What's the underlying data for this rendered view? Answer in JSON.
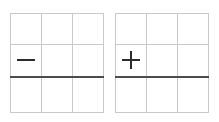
{
  "figure": {
    "title": "",
    "background_color": "#ffffff",
    "width": 219,
    "height": 122
  },
  "style": {
    "grid_line_color": "#c9c9c9",
    "baseline_color": "#4c4c4c",
    "operator_color": "#2b2b2b"
  },
  "panels": [
    {
      "id": "panel-minus",
      "operator": "minus",
      "operator_symbol": "−",
      "grid_columns": 3,
      "grid_rows": 3,
      "baseline_row_boundary": 2,
      "operator_cell_row": 2,
      "operator_cell_column": 1
    },
    {
      "id": "panel-plus",
      "operator": "plus",
      "operator_symbol": "+",
      "grid_columns": 3,
      "grid_rows": 3,
      "baseline_row_boundary": 2,
      "operator_cell_row": 2,
      "operator_cell_column": 1
    }
  ]
}
